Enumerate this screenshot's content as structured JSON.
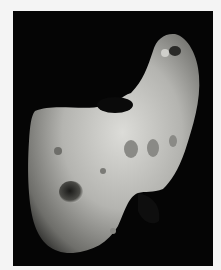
{
  "image": {
    "subject": "asteroid",
    "colors": {
      "page_background": "#f4f4f4",
      "space": "#050505",
      "surface_light": "#d8d8d4",
      "surface_mid": "#9a9a96",
      "surface_dark": "#3a3a38"
    }
  }
}
